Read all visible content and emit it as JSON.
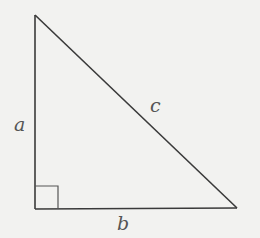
{
  "diagram": {
    "type": "right-triangle",
    "labels": {
      "a": "a",
      "b": "b",
      "c": "c"
    },
    "colors": {
      "background": "#f2f2f0",
      "stroke": "#3a3a3a",
      "label": "#555555"
    }
  }
}
